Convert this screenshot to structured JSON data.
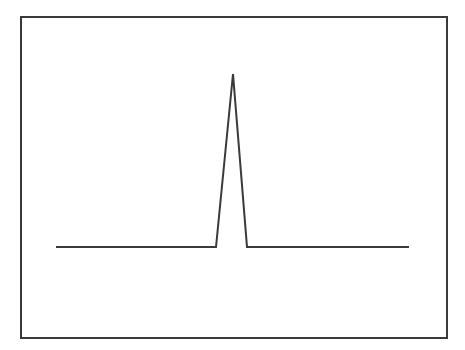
{
  "chart_data": {
    "type": "line",
    "title": "",
    "xlabel": "",
    "ylabel": "",
    "grid": false,
    "legend": null,
    "line_color": "#3a3a3a",
    "frame_color": "#3a3a3a",
    "x": [
      0,
      0.455,
      0.5,
      0.545,
      1
    ],
    "y": [
      0,
      0,
      1,
      0,
      0
    ],
    "series": [
      {
        "name": "signal",
        "points_px": [
          [
            56,
            247
          ],
          [
            216,
            247
          ],
          [
            233,
            74
          ],
          [
            247,
            247
          ],
          [
            409,
            247
          ]
        ]
      }
    ],
    "xlim": [
      0,
      1
    ],
    "ylim": [
      -0.5,
      1.1
    ]
  }
}
